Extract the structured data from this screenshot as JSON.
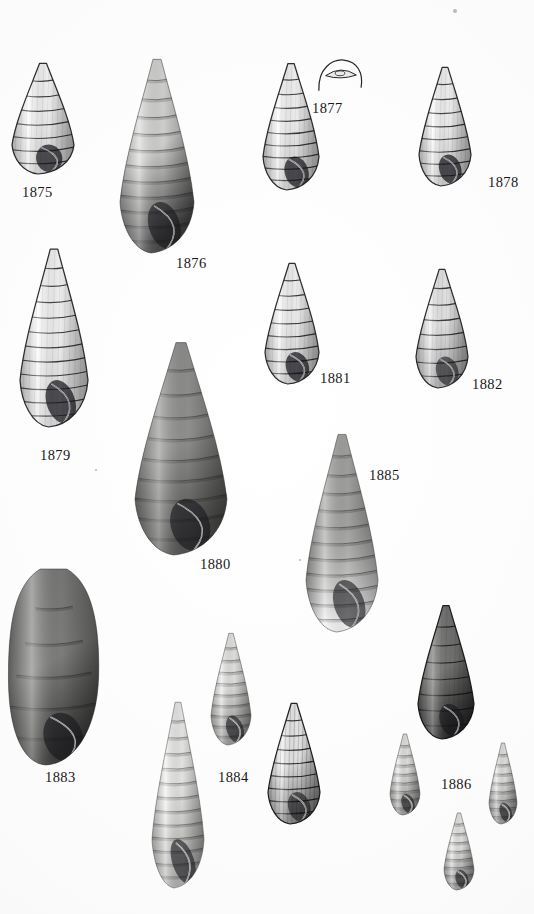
{
  "plate": {
    "background_color": "#fbfbfb",
    "ink_color": "#17171a",
    "width": 534,
    "height": 914,
    "caption_font_size_px": 14.5
  },
  "figures": [
    {
      "id": "fig-1875",
      "label": "1875",
      "kind": "engraving",
      "subject": "gastropod-shell",
      "description": "short conical shell with rounded body whorl and large aperture",
      "whorls": 7,
      "label_x": 22,
      "label_y": 185,
      "shell_x": 12,
      "shell_y": 62,
      "shell_w": 62,
      "shell_h": 112,
      "tone": "light",
      "fill_top": "#fdfdfd",
      "fill_bottom": "#e2e2e2",
      "line": "#1d1d20"
    },
    {
      "id": "fig-1876",
      "label": "1876",
      "kind": "photograph",
      "subject": "gastropod-shell",
      "description": "tall slender turreted shell, dark grey, many whorls",
      "whorls": 11,
      "label_x": 176,
      "label_y": 256,
      "shell_x": 120,
      "shell_y": 57,
      "shell_w": 74,
      "shell_h": 196,
      "tone": "dark",
      "fill_top": "#d8d8d6",
      "fill_bottom": "#4b4b4b",
      "line": "#2a2a2a"
    },
    {
      "id": "fig-1877",
      "label": "1877",
      "kind": "line-drawing",
      "subject": "operculum",
      "description": "small arched operculum outline with inner lens-shaped nucleus",
      "whorls": 0,
      "label_x": 312,
      "label_y": 101,
      "shell_x": 316,
      "shell_y": 58,
      "shell_w": 48,
      "shell_h": 34,
      "tone": "outline",
      "fill_top": "#ffffff",
      "fill_bottom": "#ffffff",
      "line": "#26262a"
    },
    {
      "id": "fig-unnumbered-left-of-1877",
      "label": "",
      "kind": "engraving",
      "subject": "gastropod-shell",
      "description": "tall conical shell with stepped whorls and shaded aperture, placed under 1877",
      "whorls": 9,
      "label_x": 0,
      "label_y": 0,
      "shell_x": 263,
      "shell_y": 62,
      "shell_w": 56,
      "shell_h": 128,
      "tone": "light",
      "fill_top": "#fdfdfd",
      "fill_bottom": "#dcdcdc",
      "line": "#1d1d20"
    },
    {
      "id": "fig-1878",
      "label": "1878",
      "kind": "engraving",
      "subject": "gastropod-shell",
      "description": "conical shell with broad flat whorls and pointed aperture",
      "whorls": 8,
      "label_x": 488,
      "label_y": 175,
      "shell_x": 419,
      "shell_y": 66,
      "shell_w": 52,
      "shell_h": 120,
      "tone": "light",
      "fill_top": "#fcfcfc",
      "fill_bottom": "#d9d9d9",
      "line": "#1d1d20"
    },
    {
      "id": "fig-1879",
      "label": "1879",
      "kind": "engraving",
      "subject": "gastropod-shell",
      "description": "large tall conical shell, white body, strong whorl lines, shaded aperture",
      "whorls": 11,
      "label_x": 40,
      "label_y": 448,
      "shell_x": 20,
      "shell_y": 247,
      "shell_w": 68,
      "shell_h": 180,
      "tone": "light",
      "fill_top": "#fdfdfd",
      "fill_bottom": "#e6e6e6",
      "line": "#1d1d20"
    },
    {
      "id": "fig-1880",
      "label": "1880",
      "kind": "photograph",
      "subject": "gastropod-shell",
      "description": "large stout dark grey shell with deeply impressed sutures",
      "whorls": 9,
      "label_x": 200,
      "label_y": 557,
      "shell_x": 135,
      "shell_y": 340,
      "shell_w": 92,
      "shell_h": 215,
      "tone": "dark",
      "fill_top": "#8f8f8d",
      "fill_bottom": "#555553",
      "line": "#303030"
    },
    {
      "id": "fig-1881",
      "label": "1881",
      "kind": "engraving",
      "subject": "gastropod-shell",
      "description": "conical shell with flat whorls and dark shaded aperture",
      "whorls": 8,
      "label_x": 320,
      "label_y": 371,
      "shell_x": 265,
      "shell_y": 262,
      "shell_w": 54,
      "shell_h": 122,
      "tone": "light",
      "fill_top": "#fcfcfc",
      "fill_bottom": "#dadada",
      "line": "#1d1d20"
    },
    {
      "id": "fig-1882",
      "label": "1882",
      "kind": "engraving",
      "subject": "gastropod-shell",
      "description": "ovate shell with rounded body whorl and elongate aperture",
      "whorls": 7,
      "label_x": 472,
      "label_y": 377,
      "shell_x": 416,
      "shell_y": 268,
      "shell_w": 52,
      "shell_h": 120,
      "tone": "mid",
      "fill_top": "#efefef",
      "fill_bottom": "#b8b8b8",
      "line": "#1d1d20"
    },
    {
      "id": "fig-1883",
      "label": "1883",
      "kind": "photograph",
      "subject": "gastropod-shell",
      "description": "very large swollen cylindrical dark shell, strongly sculptured",
      "whorls": 5,
      "label_x": 45,
      "label_y": 770,
      "shell_x": 8,
      "shell_y": 565,
      "shell_w": 92,
      "shell_h": 200,
      "tone": "dark",
      "fill_top": "#7a7a78",
      "fill_bottom": "#3c3c3a",
      "line": "#2c2c2c"
    },
    {
      "id": "fig-1884",
      "label": "1884",
      "kind": "photograph",
      "subject": "gastropod-shell",
      "description": "small pale slender shell with dark aperture",
      "whorls": 9,
      "label_x": 218,
      "label_y": 770,
      "shell_x": 211,
      "shell_y": 632,
      "shell_w": 40,
      "shell_h": 113,
      "tone": "pale",
      "fill_top": "#e9e9e7",
      "fill_bottom": "#9b9b99",
      "line": "#444444"
    },
    {
      "id": "fig-unnumbered-tall-pale",
      "label": "",
      "kind": "photograph",
      "subject": "gastropod-shell",
      "description": "tall pale slender shell at bottom centre-left, extends to page edge",
      "whorls": 12,
      "label_x": 0,
      "label_y": 0,
      "shell_x": 152,
      "shell_y": 700,
      "shell_w": 52,
      "shell_h": 188,
      "tone": "pale",
      "fill_top": "#efefed",
      "fill_bottom": "#b5b5b3",
      "line": "#4a4a4a"
    },
    {
      "id": "fig-unnumbered-hatched",
      "label": "",
      "kind": "engraving",
      "subject": "gastropod-shell",
      "description": "high-contrast hatched conical shell right of 1884",
      "whorls": 8,
      "label_x": 0,
      "label_y": 0,
      "shell_x": 268,
      "shell_y": 702,
      "shell_w": 52,
      "shell_h": 122,
      "tone": "contrast",
      "fill_top": "#f2f2f2",
      "fill_bottom": "#8a8a8a",
      "line": "#111113"
    },
    {
      "id": "fig-1886",
      "label": "1886",
      "kind": "engraving",
      "subject": "gastropod-shell",
      "description": "dark heavily shaded ovate shell with flaring lip, plus three small pale shells around the caption",
      "whorls": 7,
      "label_x": 441,
      "label_y": 777,
      "shell_x": 418,
      "shell_y": 604,
      "shell_w": 56,
      "shell_h": 135,
      "tone": "dark",
      "fill_top": "#6f6f6d",
      "fill_bottom": "#2e2e2e",
      "line": "#141416"
    },
    {
      "id": "fig-1886-small-left",
      "label": "",
      "kind": "photograph",
      "subject": "gastropod-shell",
      "description": "small pale shell left of the 1886 caption",
      "whorls": 8,
      "label_x": 0,
      "label_y": 0,
      "shell_x": 390,
      "shell_y": 733,
      "shell_w": 30,
      "shell_h": 82,
      "tone": "pale",
      "fill_top": "#e7e7e5",
      "fill_bottom": "#9d9d9b",
      "line": "#454545"
    },
    {
      "id": "fig-1886-small-right",
      "label": "",
      "kind": "photograph",
      "subject": "gastropod-shell",
      "description": "small pale shell right of the 1886 caption",
      "whorls": 8,
      "label_x": 0,
      "label_y": 0,
      "shell_x": 489,
      "shell_y": 742,
      "shell_w": 28,
      "shell_h": 82,
      "tone": "pale",
      "fill_top": "#e7e7e5",
      "fill_bottom": "#9a9a98",
      "line": "#454545"
    },
    {
      "id": "fig-1886-small-bottom",
      "label": "",
      "kind": "photograph",
      "subject": "gastropod-shell",
      "description": "small pale shell below the 1886 caption",
      "whorls": 8,
      "label_x": 0,
      "label_y": 0,
      "shell_x": 444,
      "shell_y": 812,
      "shell_w": 30,
      "shell_h": 78,
      "tone": "pale",
      "fill_top": "#eaeae8",
      "fill_bottom": "#9f9f9d",
      "line": "#454545"
    },
    {
      "id": "fig-1885",
      "label": "1885",
      "kind": "photograph",
      "subject": "gastropod-shell",
      "description": "large tall grey shell with ribbed whorls and broad aperture",
      "whorls": 11,
      "label_x": 369,
      "label_y": 468,
      "shell_x": 306,
      "shell_y": 432,
      "shell_w": 72,
      "shell_h": 200,
      "tone": "mid",
      "fill_top": "#a3a3a1",
      "fill_bottom": "#66666400",
      "line": "#333333"
    }
  ],
  "specks": [
    {
      "x": 455,
      "y": 11,
      "r": 2.0
    },
    {
      "x": 96,
      "y": 470,
      "r": 1.4
    },
    {
      "x": 300,
      "y": 560,
      "r": 1.2
    }
  ]
}
